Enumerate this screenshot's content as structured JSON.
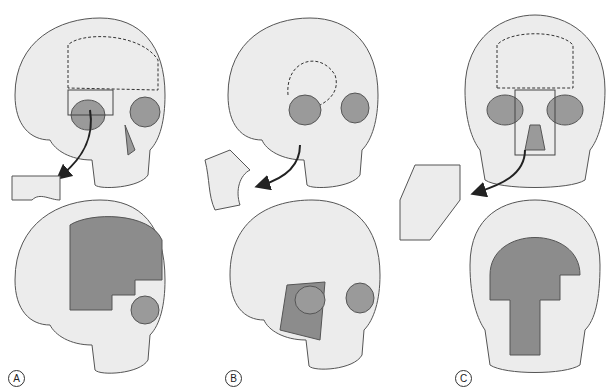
{
  "figure": {
    "panels": [
      {
        "label": "A",
        "description": "Oblique skull with frontal-orbital bone flap removed; resulting defect shown shaded"
      },
      {
        "label": "B",
        "description": "Oblique skull with zygomatic-orbital bone segment removed; lateral defect shown shaded"
      },
      {
        "label": "C",
        "description": "Frontal skull with midface (nasal/maxillary) segment removed; large central defect shown shaded"
      }
    ],
    "colors": {
      "bone": "#ececec",
      "outline": "#555555",
      "defect": "#8c8c8c",
      "orbit": "#9a9a9a",
      "arrow": "#222222"
    }
  }
}
